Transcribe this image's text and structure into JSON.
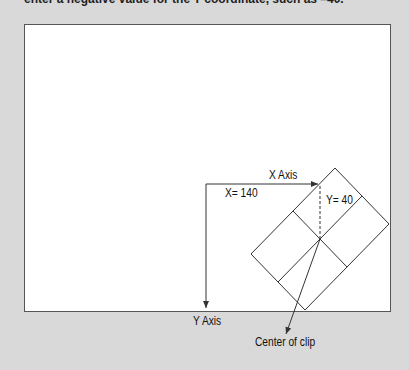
{
  "intro_text": "enter a negative value for the Y coordinate, such as –40.",
  "labels": {
    "x_axis": "X Axis",
    "y_axis": "Y Axis",
    "x_value": "X= 140",
    "y_value": "Y= 40",
    "center": "Center of clip"
  },
  "colors": {
    "background": "#d9d9d9",
    "panel": "#ffffff",
    "line": "#333333"
  }
}
